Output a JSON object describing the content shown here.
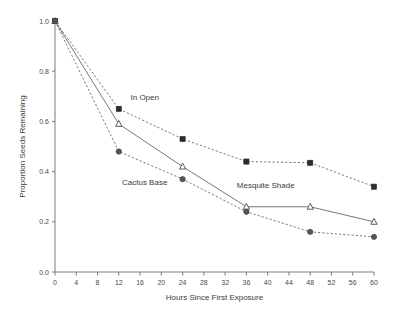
{
  "chart_data": {
    "type": "line",
    "title": "",
    "subtitle": "",
    "xlabel": "Hours Since First Exposure",
    "ylabel": "Proportion Seeds Remaining",
    "x": [
      0,
      12,
      24,
      36,
      48,
      60
    ],
    "xlim": [
      0,
      60
    ],
    "ylim": [
      0.0,
      1.0
    ],
    "grid": false,
    "legend_position": "inline-annotations",
    "xticks": [
      0,
      4,
      8,
      12,
      16,
      20,
      24,
      28,
      32,
      36,
      40,
      44,
      48,
      52,
      56,
      60
    ],
    "xtick_labels": [
      "0",
      "4",
      "8",
      "12",
      "16",
      "20",
      "24",
      "28",
      "32",
      "36",
      "40",
      "44",
      "48",
      "52",
      "56",
      "60"
    ],
    "yticks": [
      0.0,
      0.2,
      0.4,
      0.6,
      0.8,
      1.0
    ],
    "ytick_labels": [
      "0.0",
      "0.2",
      "0.4",
      "0.6",
      "0.8",
      "1.0"
    ],
    "series": [
      {
        "name": "In Open",
        "marker": "filled-square",
        "line_style": "dashed",
        "color": "#2b2b2b",
        "values": [
          1.0,
          0.65,
          0.53,
          0.44,
          0.435,
          0.34
        ]
      },
      {
        "name": "Mesquite Shade",
        "marker": "open-triangle",
        "line_style": "solid",
        "color": "#4a4a4a",
        "values": [
          1.0,
          0.59,
          0.42,
          0.26,
          0.26,
          0.2
        ]
      },
      {
        "name": "Cactus Base",
        "marker": "filled-circle",
        "line_style": "dashed",
        "color": "#555555",
        "values": [
          1.0,
          0.48,
          0.37,
          0.24,
          0.16,
          0.14
        ]
      }
    ],
    "annotations": [
      {
        "text": "In Open",
        "x": 14.2,
        "y": 0.685
      },
      {
        "text": "Cactus Base",
        "x": 12.6,
        "y": 0.345
      },
      {
        "text": "Mesquite Shade",
        "x": 34.2,
        "y": 0.335
      }
    ]
  }
}
